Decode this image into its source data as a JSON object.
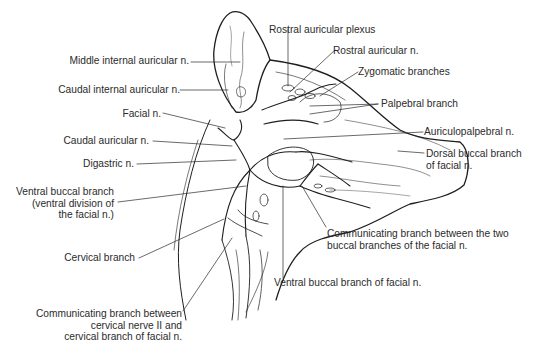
{
  "figure": {
    "labels": {
      "rostral_auricular_plexus": "Rostral auricular plexus",
      "middle_internal_auricular": "Middle internal auricular n.",
      "rostral_auricular_n": "Rostral auricular n.",
      "zygomatic_branches": "Zygomatic branches",
      "caudal_internal_auricular": "Caudal internal auricular n.",
      "palpebral_branch": "Palpebral branch",
      "facial_n": "Facial n.",
      "auriculopalpebral": "Auriculopalpebral n.",
      "caudal_auricular": "Caudal auricular n.",
      "dorsal_buccal_1": "Dorsal buccal branch",
      "dorsal_buccal_2": "of facial n.",
      "digastric": "Digastric n.",
      "ventral_buccal_div_1": "Ventral buccal branch",
      "ventral_buccal_div_2": "(ventral division of",
      "ventral_buccal_div_3": "the facial n.)",
      "communicating_buccal_1": "Communicating branch between the two",
      "communicating_buccal_2": "buccal branches of the facial n.",
      "cervical_branch": "Cervical branch",
      "ventral_buccal_facial": "Ventral buccal branch of facial n.",
      "communicating_cervical_1": "Communicating branch between",
      "communicating_cervical_2": "cervical nerve II and",
      "communicating_cervical_3": "cervical branch of facial n."
    },
    "colors": {
      "line": "#1e1e1e",
      "text": "#2b2b2b",
      "background": "#ffffff"
    }
  }
}
